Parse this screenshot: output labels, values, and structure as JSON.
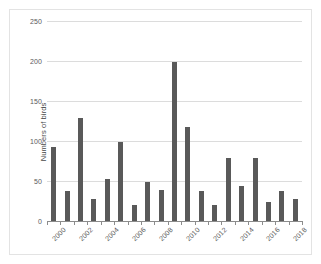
{
  "chart_data": {
    "type": "bar",
    "title": "",
    "xlabel": "",
    "ylabel": "Numbers of birds",
    "categories": [
      "2000",
      "2001",
      "2002",
      "2003",
      "2004",
      "2005",
      "2006",
      "2007",
      "2008",
      "2009",
      "2010",
      "2011",
      "2012",
      "2013",
      "2014",
      "2015",
      "2016",
      "2017",
      "2018"
    ],
    "values": [
      92,
      37,
      129,
      28,
      52,
      99,
      20,
      49,
      39,
      199,
      118,
      37,
      20,
      79,
      44,
      79,
      24,
      38,
      28
    ],
    "ylim": [
      0,
      250
    ],
    "yticks": [
      0,
      50,
      100,
      150,
      200,
      250
    ],
    "ytick_labels": [
      "0",
      "50",
      "100",
      "150",
      "200",
      "250"
    ],
    "xtick_labels": [
      "2000",
      "2002",
      "2004",
      "2006",
      "2008",
      "2010",
      "2012",
      "2014",
      "2016",
      "2018"
    ],
    "xtick_label_indices": [
      0,
      2,
      4,
      6,
      8,
      10,
      12,
      14,
      16,
      18
    ],
    "grid": true,
    "legend": "none",
    "bar_color": "#595959",
    "gridline_color": "#dcdcdc",
    "axis_color": "#8c8c8c",
    "background_color": "#ffffff"
  }
}
